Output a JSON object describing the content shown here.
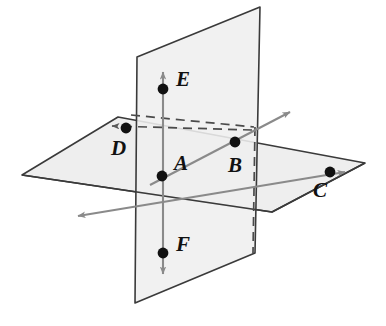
{
  "figure": {
    "background_color": "#ffffff",
    "caption": "",
    "colors": {
      "plane_fill": "#eeeeee",
      "plane_fill_vertical": "#efefef",
      "plane_edge": "#3a3a3a",
      "line_gray": "#8a8a8a",
      "line_dark": "#333333",
      "dashed": "#4a4a4a",
      "point_fill": "#111111",
      "label_color": "#111111"
    },
    "planes": [
      {
        "name": "horizontal-plane",
        "shape": "parallelogram",
        "points": "22,175 118,117 365,163 272,212"
      },
      {
        "name": "vertical-plane",
        "shape": "quadrilateral",
        "points": "137,57 260,7 255,253 135,303"
      }
    ],
    "points": [
      {
        "id": "A",
        "label": "A",
        "x": 162,
        "y": 176,
        "label_x": 174,
        "label_y": 170
      },
      {
        "id": "B",
        "label": "B",
        "x": 235,
        "y": 142,
        "label_x": 230,
        "label_y": 171
      },
      {
        "id": "C",
        "label": "C",
        "x": 330,
        "y": 172,
        "label_x": 316,
        "label_y": 196
      },
      {
        "id": "D",
        "label": "D",
        "x": 126,
        "y": 128,
        "label_x": 113,
        "label_y": 154
      },
      {
        "id": "E",
        "label": "E",
        "x": 163,
        "y": 89,
        "label_x": 175,
        "label_y": 85
      },
      {
        "id": "F",
        "label": "F",
        "x": 163,
        "y": 253,
        "label_x": 175,
        "label_y": 250
      }
    ],
    "lines": [
      {
        "name": "vertical-line-EF",
        "style": "solid",
        "color": "#8a8a8a",
        "arrows": "both"
      },
      {
        "name": "line-through-A-B-C",
        "style": "solid",
        "color": "#8a8a8a",
        "arrows": "both"
      },
      {
        "name": "line-up-right-through-B",
        "style": "solid",
        "color": "#8a8a8a",
        "arrows": "one"
      },
      {
        "name": "dashed-line-through-D",
        "style": "dashed",
        "color": "#4a4a4a",
        "arrows": "one"
      },
      {
        "name": "dashed-line-upper",
        "style": "dashed",
        "color": "#4a4a4a",
        "arrows": "none"
      },
      {
        "name": "dashed-vertical-right",
        "style": "dashed",
        "color": "#4a4a4a",
        "arrows": "none"
      }
    ]
  }
}
